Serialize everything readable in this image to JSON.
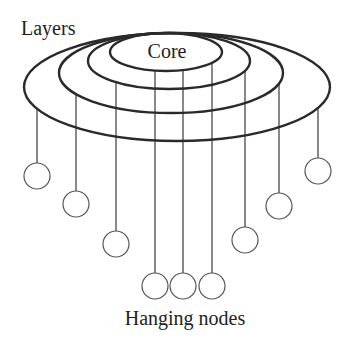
{
  "diagram": {
    "title_labels": {
      "layers": "Layers",
      "core": "Core",
      "hanging_nodes": "Hanging nodes"
    },
    "colors": {
      "background": "#ffffff",
      "stroke": "#2a2a2a",
      "text": "#222222",
      "node_stroke": "#555555"
    },
    "layers": [
      {
        "name": "core",
        "cx": 166,
        "cy": 52,
        "rx": 56,
        "ry": 19
      },
      {
        "name": "layer-2",
        "cx": 169,
        "cy": 61,
        "rx": 81,
        "ry": 28
      },
      {
        "name": "layer-3",
        "cx": 171,
        "cy": 73,
        "rx": 112,
        "ry": 40
      },
      {
        "name": "layer-4-outer",
        "cx": 177,
        "cy": 87,
        "rx": 153,
        "ry": 54
      }
    ],
    "hanging_nodes": [
      {
        "x": 37,
        "y": 176,
        "from_layer": 3
      },
      {
        "x": 76,
        "y": 204,
        "from_layer": 2
      },
      {
        "x": 116,
        "y": 244,
        "from_layer": 1
      },
      {
        "x": 155,
        "y": 286,
        "from_layer": 0
      },
      {
        "x": 183,
        "y": 286,
        "from_layer": 0
      },
      {
        "x": 212,
        "y": 286,
        "from_layer": 0
      },
      {
        "x": 245,
        "y": 240,
        "from_layer": 1
      },
      {
        "x": 279,
        "y": 206,
        "from_layer": 2
      },
      {
        "x": 318,
        "y": 171,
        "from_layer": 3
      }
    ],
    "node_radius": 13
  }
}
